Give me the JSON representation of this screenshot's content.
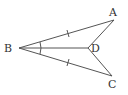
{
  "diagram": {
    "type": "geometry",
    "stroke_color": "#555555",
    "label_color": "#333333",
    "points": {
      "A": {
        "label": "A",
        "x": 114,
        "y": 20
      },
      "B": {
        "label": "B",
        "x": 19,
        "y": 48
      },
      "C": {
        "label": "C",
        "x": 112,
        "y": 76
      },
      "D": {
        "label": "D",
        "x": 88,
        "y": 48
      }
    },
    "segments": [
      "BA",
      "BD",
      "BC",
      "AD",
      "CD"
    ],
    "equal_marks": [
      "BA",
      "BC"
    ],
    "angle_marks": [
      "ABD",
      "DBC"
    ]
  }
}
